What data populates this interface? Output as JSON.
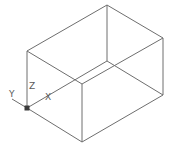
{
  "diagram": {
    "type": "isometric-wireframe-box",
    "edge_color": "#6e6e6e",
    "background": "#ffffff",
    "vertices": {
      "top_back": [
        107,
        5
      ],
      "top_left": [
        27,
        51
      ],
      "top_right": [
        163,
        38
      ],
      "top_front": [
        82,
        84
      ],
      "bottom_left": [
        27,
        108
      ],
      "bottom_front": [
        82,
        142
      ],
      "bottom_right": [
        163,
        95
      ],
      "bottom_back": [
        107,
        61
      ]
    },
    "edges": [
      [
        "top_back",
        "top_left"
      ],
      [
        "top_back",
        "top_right"
      ],
      [
        "top_left",
        "top_front"
      ],
      [
        "top_right",
        "top_front"
      ],
      [
        "top_left",
        "bottom_left"
      ],
      [
        "top_front",
        "bottom_front"
      ],
      [
        "top_right",
        "bottom_right"
      ],
      [
        "bottom_left",
        "bottom_front"
      ],
      [
        "bottom_front",
        "bottom_right"
      ],
      [
        "top_back",
        "bottom_back"
      ],
      [
        "bottom_back",
        "bottom_left"
      ],
      [
        "bottom_back",
        "bottom_right"
      ]
    ]
  },
  "ucs_icon": {
    "origin": [
      27,
      108
    ],
    "labels": {
      "x": "X",
      "y": "Y",
      "z": "Z"
    }
  }
}
